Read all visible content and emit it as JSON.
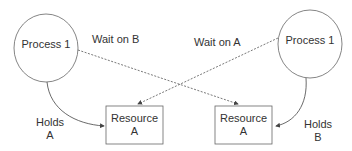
{
  "diagram": {
    "nodes": [
      {
        "id": "process-left",
        "type": "process",
        "label": "Process 1"
      },
      {
        "id": "process-right",
        "type": "process",
        "label": "Process 1"
      },
      {
        "id": "resource-left",
        "type": "resource",
        "label_line1": "Resource",
        "label_line2": "A"
      },
      {
        "id": "resource-right",
        "type": "resource",
        "label_line1": "Resource",
        "label_line2": "A"
      }
    ],
    "edges": [
      {
        "from": "process-left",
        "to": "resource-left",
        "style": "solid",
        "label_line1": "Holds",
        "label_line2": "A"
      },
      {
        "from": "process-right",
        "to": "resource-right",
        "style": "solid",
        "label_line1": "Holds",
        "label_line2": "B"
      },
      {
        "from": "process-left",
        "to": "resource-right",
        "style": "dashed",
        "label": "Wait on B"
      },
      {
        "from": "process-right",
        "to": "resource-left",
        "style": "dashed",
        "label": "Wait on A"
      }
    ]
  },
  "colors": {
    "stroke": "#555555",
    "text": "#333333",
    "background": "#ffffff"
  }
}
